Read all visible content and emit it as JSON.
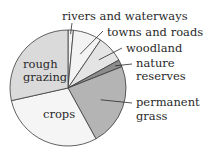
{
  "chart_data": {
    "type": "pie",
    "title": "",
    "slices": [
      {
        "label": "rivers and waterways",
        "value": 1.5,
        "color": "#f4f4f4"
      },
      {
        "label": "towns and roads",
        "value": 8,
        "color": "#f3f3f3"
      },
      {
        "label": "woodland",
        "value": 7.5,
        "color": "#e4e4e4"
      },
      {
        "label": "nature reserves",
        "value": 2,
        "color": "#8c8c8c"
      },
      {
        "label": "permanent grass",
        "value": 23,
        "color": "#b4b4b4"
      },
      {
        "label": "crops",
        "value": 29.5,
        "color": "#f5f5f5"
      },
      {
        "label": "rough grazing",
        "value": 28.5,
        "color": "#dadada"
      }
    ],
    "start": "top",
    "direction": "clockwise",
    "labels": {
      "rivers": "rivers and waterways",
      "towns": "towns and roads",
      "woodland": "woodland",
      "nature_1": "nature",
      "nature_2": "reserves",
      "grass_1": "permanent",
      "grass_2": "grass",
      "crops": "crops",
      "rough_1": "rough",
      "rough_2": "grazing"
    }
  }
}
